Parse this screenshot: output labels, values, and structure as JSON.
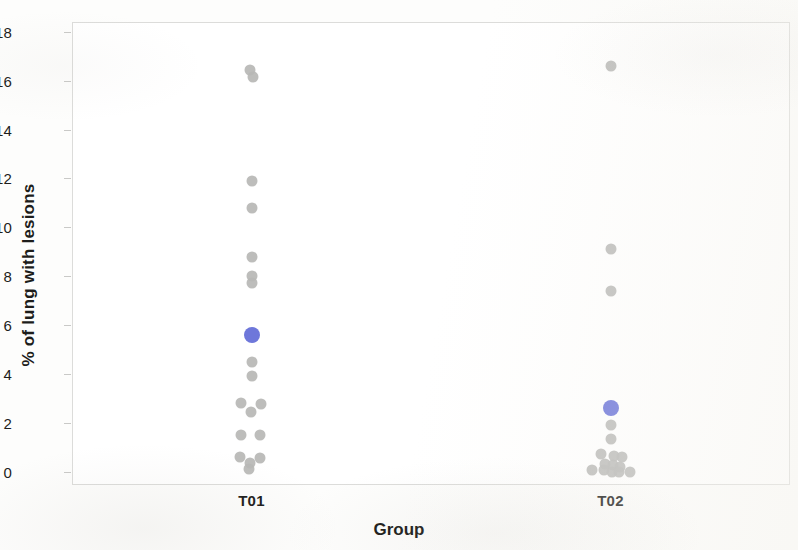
{
  "chart_data": {
    "type": "scatter",
    "title": "",
    "xlabel": "Group",
    "ylabel": "% of lung with lesions",
    "categories": [
      "T01",
      "T02"
    ],
    "yticks": [
      0,
      2,
      4,
      6,
      8,
      10,
      12,
      14,
      16,
      18
    ],
    "ylim": [
      -0.55,
      18.4
    ],
    "grid": false,
    "legend": null,
    "colors": {
      "data_point": "#b7b7b5",
      "mean_marker": "#6670d8",
      "axis_text": "#1d1d1b",
      "frame": "#dcdcda",
      "background": "#ffffff"
    },
    "series": [
      {
        "name": "T01",
        "category": "T01",
        "marker": "gray-dot",
        "points": [
          {
            "y": 16.45,
            "jitter": -0.1
          },
          {
            "y": 16.15,
            "jitter": 0.05
          },
          {
            "y": 11.9,
            "jitter": 0.0
          },
          {
            "y": 10.8,
            "jitter": 0.0
          },
          {
            "y": 8.8,
            "jitter": 0.0
          },
          {
            "y": 8.0,
            "jitter": 0.0
          },
          {
            "y": 7.7,
            "jitter": 0.0
          },
          {
            "y": 4.5,
            "jitter": 0.0
          },
          {
            "y": 3.9,
            "jitter": 0.0
          },
          {
            "y": 2.8,
            "jitter": -0.55
          },
          {
            "y": 2.75,
            "jitter": 0.45
          },
          {
            "y": 2.45,
            "jitter": -0.05
          },
          {
            "y": 1.5,
            "jitter": -0.55
          },
          {
            "y": 1.5,
            "jitter": 0.4
          },
          {
            "y": 0.6,
            "jitter": -0.6
          },
          {
            "y": 0.55,
            "jitter": 0.4
          },
          {
            "y": 0.35,
            "jitter": -0.1
          },
          {
            "y": 0.1,
            "jitter": -0.15
          }
        ],
        "mean": {
          "y": 5.6,
          "jitter": 0.0
        }
      },
      {
        "name": "T02",
        "category": "T02",
        "marker": "gray-dot",
        "points": [
          {
            "y": 16.6,
            "jitter": 0.0
          },
          {
            "y": 9.1,
            "jitter": 0.0
          },
          {
            "y": 7.4,
            "jitter": 0.0
          },
          {
            "y": 1.9,
            "jitter": 0.0
          },
          {
            "y": 1.35,
            "jitter": 0.0
          },
          {
            "y": 0.7,
            "jitter": -0.5
          },
          {
            "y": 0.65,
            "jitter": 0.15
          },
          {
            "y": 0.6,
            "jitter": 0.55
          },
          {
            "y": 0.3,
            "jitter": -0.3
          },
          {
            "y": 0.25,
            "jitter": 0.1
          },
          {
            "y": 0.2,
            "jitter": 0.45
          },
          {
            "y": 0.05,
            "jitter": -0.95
          },
          {
            "y": 0.05,
            "jitter": -0.35
          },
          {
            "y": 0.0,
            "jitter": 0.05
          },
          {
            "y": 0.0,
            "jitter": 0.4
          },
          {
            "y": 0.0,
            "jitter": 0.95
          }
        ],
        "mean": {
          "y": 2.6,
          "jitter": 0.0
        }
      }
    ]
  },
  "axes": {
    "y_title": "% of lung with lesions",
    "x_title": "Group",
    "y_tick_labels": [
      "0",
      "2",
      "4",
      "6",
      "8",
      "10",
      "12",
      "14",
      "16",
      "18"
    ],
    "x_tick_labels": [
      "T01",
      "T02"
    ]
  }
}
